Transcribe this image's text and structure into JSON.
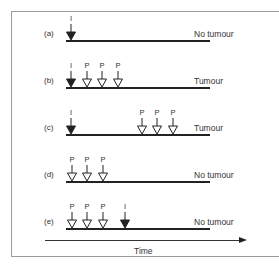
{
  "diagram": {
    "type": "timeline-schematic",
    "rows": [
      {
        "id": "a",
        "label": "(a)",
        "outcome": "No tumour",
        "events": [
          {
            "type": "I",
            "x": 71
          }
        ]
      },
      {
        "id": "b",
        "label": "(b)",
        "outcome": "Tumour",
        "events": [
          {
            "type": "I",
            "x": 71
          },
          {
            "type": "P",
            "x": 87
          },
          {
            "type": "P",
            "x": 102
          },
          {
            "type": "P",
            "x": 118
          }
        ]
      },
      {
        "id": "c",
        "label": "(c)",
        "outcome": "Tumour",
        "events": [
          {
            "type": "I",
            "x": 71
          },
          {
            "type": "P",
            "x": 142
          },
          {
            "type": "P",
            "x": 157
          },
          {
            "type": "P",
            "x": 173
          }
        ]
      },
      {
        "id": "d",
        "label": "(d)",
        "outcome": "No tumour",
        "events": [
          {
            "type": "P",
            "x": 72
          },
          {
            "type": "P",
            "x": 87
          },
          {
            "type": "P",
            "x": 103
          }
        ]
      },
      {
        "id": "e",
        "label": "(e)",
        "outcome": "No tumour",
        "events": [
          {
            "type": "P",
            "x": 72
          },
          {
            "type": "P",
            "x": 87
          },
          {
            "type": "P",
            "x": 103
          },
          {
            "type": "I",
            "x": 125
          }
        ]
      }
    ],
    "legend": {
      "I": "filled arrowhead",
      "P": "open arrowhead"
    },
    "axis": {
      "label": "Time",
      "direction": "left-to-right"
    },
    "colors": {
      "line": "#222222",
      "frame": "#9a9a9a",
      "text": "#333333"
    }
  }
}
